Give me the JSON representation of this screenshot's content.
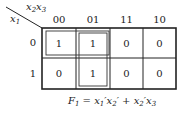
{
  "kmap": {
    "row_variable": "x1",
    "col_variables": "x2x3",
    "col_headers": [
      "00",
      "01",
      "11",
      "10"
    ],
    "row_headers": [
      "0",
      "1"
    ],
    "cells": [
      [
        "1",
        "1",
        "0",
        "0"
      ],
      [
        "0",
        "1",
        "0",
        "0"
      ]
    ],
    "groups": [
      {
        "cells": [
          [
            0,
            0
          ],
          [
            0,
            1
          ]
        ],
        "term": "x1'x2'"
      },
      {
        "cells": [
          [
            0,
            1
          ],
          [
            1,
            1
          ]
        ],
        "term": "x2'x3"
      }
    ]
  },
  "equation": {
    "lhs": "F",
    "lhs_sub": "1",
    "rhs": "= x1'x2' + x2'x3"
  }
}
